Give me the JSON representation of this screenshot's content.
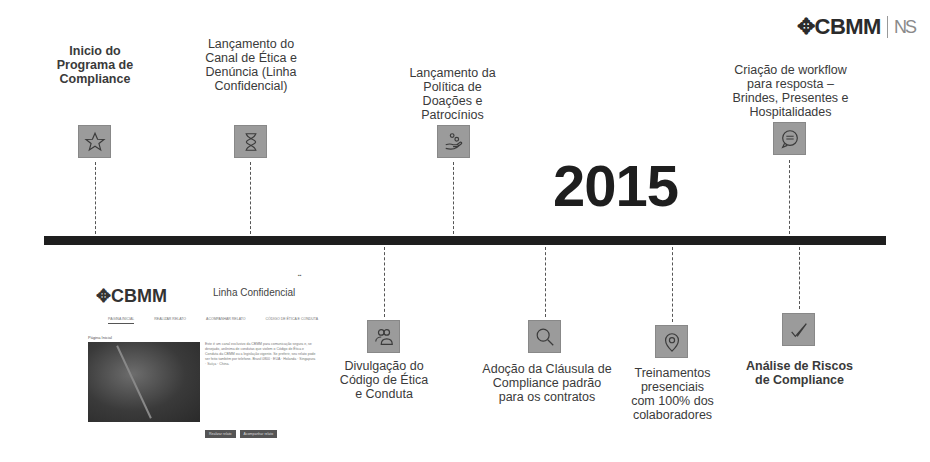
{
  "logo": {
    "brand": "CBMM",
    "secondary": "NS"
  },
  "year": "2015",
  "events_top": [
    {
      "id": "inicio",
      "title": "Inicio do\nPrograma de\nCompliance",
      "icon": "star-icon"
    },
    {
      "id": "canal",
      "title": "Lançamento do\nCanal de Ética e\nDenúncia (Linha\nConfidencial)",
      "icon": "hourglass-icon"
    },
    {
      "id": "politica",
      "title": "Lançamento da\nPolítica de\nDoações e\nPatrocínios",
      "icon": "hand-coins-icon"
    },
    {
      "id": "workflow",
      "title": "Criação de workflow\npara resposta –\nBrindes, Presentes e\nHospitalidades",
      "icon": "chat-bubble-icon"
    }
  ],
  "events_bottom": [
    {
      "id": "codigo",
      "title": "Divulgação do\nCódigo de Ética\ne Conduta",
      "icon": "people-icon"
    },
    {
      "id": "clausula",
      "title": "Adoção da Cláusula de\nCompliance padrão\npara os contratos",
      "icon": "magnifier-icon"
    },
    {
      "id": "treinamentos",
      "title": "Treinamentos\npresenciais\ncom 100% dos\ncolaboradores",
      "icon": "location-pin-icon"
    },
    {
      "id": "riscos",
      "title": "Análise de Riscos\nde Compliance",
      "icon": "check-icon"
    }
  ],
  "screenshot": {
    "logo": "CBMM",
    "title": "Linha Confidencial",
    "flags": "▪▪",
    "tabs": [
      "Página inicial",
      "Realizar relato",
      "Acompanhar relato",
      "Código de ética e conduta"
    ],
    "heading": "Página Inicial",
    "body": "Este é um canal exclusivo da CBMM para comunicação segura e, se desejado, anônima de condutas que violem o Código de Ética e Conduta da CBMM ou a legislação vigente. Se preferir, seu relato pode ser feito também por telefone. Brasil 0800 · EUA · Holanda · Singapura · Suíça · China.",
    "buttons": [
      "Realizar relato",
      "Acompanhar relato"
    ]
  }
}
